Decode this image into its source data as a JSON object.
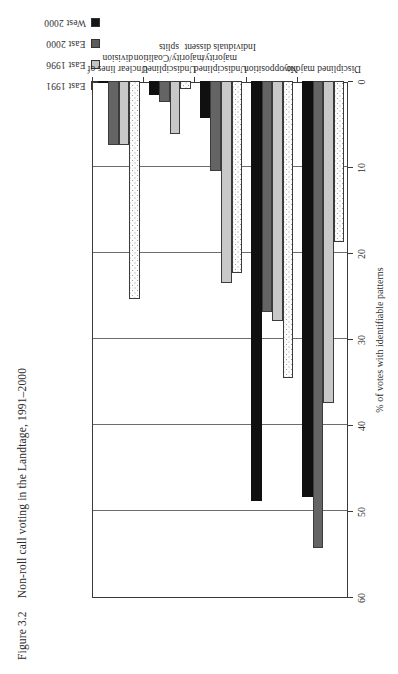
{
  "figure": {
    "number": "Figure 3.2",
    "title": "Non-roll call voting in the Landtage, 1991–2000"
  },
  "legend": {
    "items": [
      {
        "label": "East 1991",
        "color": "#ffffff",
        "key": "east_1991"
      },
      {
        "label": "East 1996",
        "color": "#c3c3c3",
        "key": "east_1996"
      },
      {
        "label": "East 2000",
        "color": "#5c5c5c",
        "key": "east_2000"
      },
      {
        "label": "West 2000",
        "color": "#151515",
        "key": "west_2000"
      }
    ]
  },
  "axis": {
    "y_title": "% of votes with identifiable patterns",
    "ticks": [
      "0",
      "10",
      "20",
      "30",
      "40",
      "50",
      "60"
    ]
  },
  "chart_data": {
    "type": "bar",
    "orientation": "horizontal",
    "title": "Non-roll call voting in the Landtage, 1991–2000",
    "xlabel": "% of votes with identifiable patterns",
    "ylabel": "",
    "xlim": [
      0,
      60
    ],
    "grid": true,
    "legend_position": "top-right",
    "categories": [
      "Disciplined majority",
      "No opposition",
      "Undisciplined majority/\nIndividuals dissent",
      "Undisciplined\nmajority/Coalition\nsplits",
      "Unclear lines of\ndivision"
    ],
    "series": [
      {
        "name": "East 1991",
        "color": "#ffffff",
        "values": [
          18.7,
          34.5,
          22.3,
          0.9,
          25.3
        ]
      },
      {
        "name": "East 1996",
        "color": "#c3c3c3",
        "values": [
          37.5,
          27.9,
          23.5,
          6.2,
          7.4
        ]
      },
      {
        "name": "East 2000",
        "color": "#5c5c5c",
        "values": [
          54.3,
          26.9,
          10.5,
          2.4,
          7.5
        ]
      },
      {
        "name": "West 2000",
        "color": "#151515",
        "values": [
          48.4,
          48.8,
          4.3,
          1.6,
          0.2
        ]
      }
    ]
  }
}
